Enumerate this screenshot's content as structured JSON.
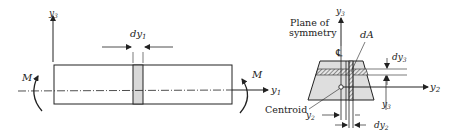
{
  "beam_view": {
    "axis_vertical_label": "y",
    "axis_vertical_sub": "3",
    "axis_horizontal_label": "y",
    "axis_horizontal_sub": "1",
    "element_width_label": "dy",
    "element_width_sub": "1",
    "moment_left_label": "M",
    "moment_right_label": "M"
  },
  "cross_section": {
    "axis_vertical_label": "y",
    "axis_vertical_sub": "3",
    "axis_horizontal_label": "y",
    "axis_horizontal_sub": "2",
    "plane_label_line1": "Plane of",
    "plane_label_line2": "symmetry",
    "centerline_symbol": "℄",
    "area_element_label": "dA",
    "strip_height_label": "dy",
    "strip_height_sub": "3",
    "y3_dimension_label": "y",
    "y3_dimension_sub": "3",
    "y2_dimension_label": "y",
    "y2_dimension_sub": "2",
    "strip_width_label": "dy",
    "strip_width_sub": "2",
    "centroid_label": "Centroid"
  },
  "colors": {
    "line": "#222222",
    "fill_section": "#dcdcdc",
    "fill_element": "#d0d0d0"
  }
}
